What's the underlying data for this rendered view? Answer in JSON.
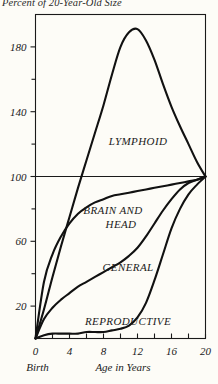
{
  "chart_data": {
    "type": "line",
    "title": "Percent of 20-Year-Old Size",
    "xlabel": "Age in Years",
    "ylabel": "Percent of 20-Year-Old Size",
    "xlim": [
      0,
      20
    ],
    "ylim": [
      0,
      200
    ],
    "grid": false,
    "reference_line": 100,
    "legend_position": "inline-annotations",
    "xticks": [
      0,
      4,
      8,
      12,
      16,
      20
    ],
    "xtick_labels": [
      "0",
      "4",
      "8",
      "12",
      "16",
      "20"
    ],
    "xminorticks": [
      0,
      2,
      4,
      6,
      8,
      10,
      12,
      14,
      16,
      18,
      20
    ],
    "yticks": [
      20,
      60,
      100,
      140,
      180
    ],
    "ytick_labels": [
      "20",
      "60",
      "100",
      "140",
      "180"
    ],
    "yminorticks": [
      40,
      80,
      120,
      160
    ],
    "origin_caption": "Birth",
    "series": [
      {
        "name": "LYMPHOID",
        "label": "LYMPHOID",
        "x": [
          0,
          1,
          2,
          3,
          4,
          5,
          6,
          7,
          8,
          9,
          10,
          11,
          12,
          13,
          14,
          15,
          16,
          17,
          18,
          19,
          20
        ],
        "values": [
          0,
          18,
          38,
          57,
          75,
          93,
          110,
          127,
          144,
          163,
          180,
          189,
          191,
          184,
          172,
          157,
          143,
          131,
          120,
          109,
          100
        ]
      },
      {
        "name": "BRAIN AND HEAD",
        "label": "BRAIN AND HEAD",
        "x": [
          0,
          1,
          2,
          3,
          4,
          5,
          6,
          7,
          8,
          9,
          10,
          11,
          12,
          13,
          14,
          15,
          16,
          17,
          18,
          19,
          20
        ],
        "values": [
          0,
          35,
          52,
          63,
          71,
          77,
          81,
          84,
          86,
          88,
          89,
          90,
          91,
          92,
          93,
          94,
          95,
          96,
          97,
          98,
          100
        ]
      },
      {
        "name": "GENERAL",
        "label": "GENERAL",
        "x": [
          0,
          1,
          2,
          3,
          4,
          5,
          6,
          7,
          8,
          9,
          10,
          11,
          12,
          13,
          14,
          15,
          16,
          17,
          18,
          19,
          20
        ],
        "values": [
          0,
          12,
          19,
          24,
          28,
          32,
          35,
          38,
          41,
          44,
          47,
          51,
          56,
          63,
          71,
          79,
          86,
          92,
          96,
          98,
          100
        ]
      },
      {
        "name": "REPRODUCTIVE",
        "label": "REPRODUCTIVE",
        "x": [
          0,
          1,
          2,
          3,
          4,
          5,
          6,
          7,
          8,
          9,
          10,
          11,
          12,
          13,
          14,
          15,
          16,
          17,
          18,
          19,
          20
        ],
        "values": [
          0,
          2,
          3,
          3,
          3,
          3,
          4,
          4,
          4,
          5,
          6,
          8,
          13,
          22,
          36,
          52,
          68,
          80,
          89,
          95,
          100
        ]
      }
    ]
  },
  "colors": {
    "background": "#fdfcf7",
    "ink": "#1a1a1a",
    "curve": "#111111"
  }
}
